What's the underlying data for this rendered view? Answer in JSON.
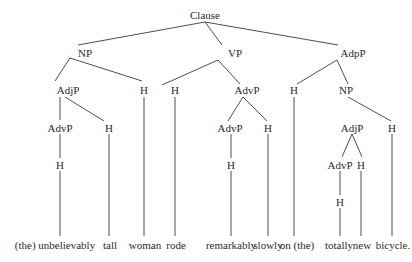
{
  "diagram": {
    "type": "syntax-tree",
    "line_color": "#3a3a3a",
    "nodes": [
      {
        "id": "clause",
        "label": "Clause",
        "x": 205,
        "y": 15
      },
      {
        "id": "np1",
        "label": "NP",
        "x": 85,
        "y": 53
      },
      {
        "id": "vp",
        "label": "VP",
        "x": 235,
        "y": 53
      },
      {
        "id": "adpp",
        "label": "AdpP",
        "x": 353,
        "y": 53
      },
      {
        "id": "adjp1",
        "label": "AdjP",
        "x": 68,
        "y": 90
      },
      {
        "id": "h_woman",
        "label": "H",
        "x": 144,
        "y": 90
      },
      {
        "id": "h_rode",
        "label": "H",
        "x": 175,
        "y": 90
      },
      {
        "id": "advp1",
        "label": "AdvP",
        "x": 247,
        "y": 90
      },
      {
        "id": "h_on",
        "label": "H",
        "x": 294,
        "y": 90
      },
      {
        "id": "np2",
        "label": "NP",
        "x": 346,
        "y": 90
      },
      {
        "id": "advp2",
        "label": "AdvP",
        "x": 60,
        "y": 128
      },
      {
        "id": "h_tall",
        "label": "H",
        "x": 109,
        "y": 128
      },
      {
        "id": "advp3",
        "label": "AdvP",
        "x": 230,
        "y": 128
      },
      {
        "id": "h_slowly",
        "label": "H",
        "x": 268,
        "y": 128
      },
      {
        "id": "adjp2",
        "label": "AdjP",
        "x": 352,
        "y": 128
      },
      {
        "id": "h_bicycle",
        "label": "H",
        "x": 392,
        "y": 128
      },
      {
        "id": "h_unbel",
        "label": "H",
        "x": 60,
        "y": 165
      },
      {
        "id": "h_remark",
        "label": "H",
        "x": 231,
        "y": 165
      },
      {
        "id": "advp4",
        "label": "AdvP",
        "x": 340,
        "y": 165
      },
      {
        "id": "h_new",
        "label": "H",
        "x": 361,
        "y": 165
      },
      {
        "id": "h_totally",
        "label": "H",
        "x": 340,
        "y": 202
      }
    ],
    "words": [
      {
        "text": "(the) unbelievably",
        "x": 55,
        "y": 245
      },
      {
        "text": "tall",
        "x": 110,
        "y": 245
      },
      {
        "text": "woman",
        "x": 145,
        "y": 245
      },
      {
        "text": "rode",
        "x": 176,
        "y": 245
      },
      {
        "text": "remarkably",
        "x": 231,
        "y": 245
      },
      {
        "text": "slowly",
        "x": 268,
        "y": 245
      },
      {
        "text": "on (the)",
        "x": 297,
        "y": 245
      },
      {
        "text": "totally",
        "x": 339,
        "y": 245
      },
      {
        "text": "new",
        "x": 362,
        "y": 245
      },
      {
        "text": "bicycle.",
        "x": 393,
        "y": 245
      }
    ],
    "edges": [
      [
        205,
        22,
        78,
        45
      ],
      [
        205,
        22,
        222,
        45
      ],
      [
        205,
        22,
        338,
        45
      ],
      [
        70,
        58,
        55,
        81
      ],
      [
        70,
        58,
        142,
        81
      ],
      [
        218,
        60,
        162,
        85
      ],
      [
        218,
        60,
        240,
        84
      ],
      [
        337,
        60,
        297,
        84
      ],
      [
        337,
        60,
        348,
        84
      ],
      [
        60,
        97,
        60,
        120
      ],
      [
        65,
        97,
        104,
        121
      ],
      [
        243,
        97,
        228,
        121
      ],
      [
        243,
        97,
        267,
        121
      ],
      [
        348,
        97,
        391,
        121
      ],
      [
        352,
        134,
        342,
        157
      ],
      [
        352,
        134,
        362,
        157
      ],
      [
        60,
        134,
        60,
        158
      ],
      [
        231,
        134,
        231,
        158
      ],
      [
        340,
        171,
        340,
        195
      ],
      [
        60,
        171,
        60,
        236
      ],
      [
        109,
        134,
        109,
        236
      ],
      [
        144,
        97,
        144,
        236
      ],
      [
        175,
        97,
        175,
        236
      ],
      [
        231,
        171,
        231,
        236
      ],
      [
        268,
        134,
        268,
        236
      ],
      [
        294,
        97,
        294,
        236
      ],
      [
        340,
        208,
        340,
        236
      ],
      [
        361,
        171,
        361,
        236
      ],
      [
        392,
        134,
        392,
        236
      ]
    ]
  }
}
